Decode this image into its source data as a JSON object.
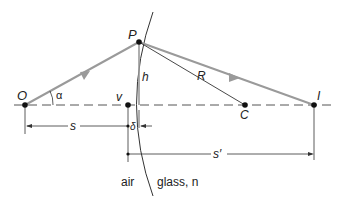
{
  "diagram": {
    "labels": {
      "object_point": "O",
      "surface_point": "P",
      "vertex": "v",
      "center": "C",
      "image_point": "I",
      "angle": "α",
      "height": "h",
      "radius": "R",
      "object_distance": "s",
      "image_distance": "s′",
      "sag": "δ",
      "medium_left": "air",
      "medium_right": "glass, n"
    },
    "colors": {
      "ray": "#9a9a9a",
      "line": "#333333",
      "point": "#111111"
    }
  }
}
